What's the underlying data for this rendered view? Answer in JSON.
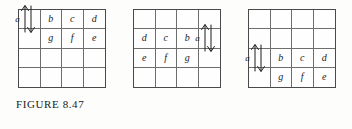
{
  "figure": {
    "caption": "FIGURE 8.47",
    "grid_rows": 4,
    "grid_cols": 4,
    "arrow_label": "a",
    "arrow_icon": "double-headed-vertical-arrow-icon",
    "line_color": "#4a4a4a",
    "inner_line_color": "#6e6e6e",
    "text_color": "#1c1c1c",
    "background": "#fdfdfb"
  },
  "grids": [
    {
      "name": "grid-left",
      "x": 18,
      "y": 9,
      "width": 88,
      "height": 79,
      "arrow": {
        "row": 1,
        "col": 1,
        "spans_rows": [
          1,
          2
        ]
      },
      "cells": [
        [
          "",
          "b",
          "c",
          "d"
        ],
        [
          "",
          "g",
          "f",
          "e"
        ],
        [
          "",
          "",
          "",
          ""
        ],
        [
          "",
          "",
          "",
          ""
        ]
      ]
    },
    {
      "name": "grid-middle",
      "x": 133,
      "y": 9,
      "width": 88,
      "height": 79,
      "arrow": {
        "row": 2,
        "col": 4,
        "spans_rows": [
          2,
          3
        ]
      },
      "cells": [
        [
          "",
          "",
          "",
          ""
        ],
        [
          "d",
          "c",
          "b",
          ""
        ],
        [
          "e",
          "f",
          "g",
          ""
        ],
        [
          "",
          "",
          "",
          ""
        ]
      ]
    },
    {
      "name": "grid-right",
      "x": 248,
      "y": 9,
      "width": 88,
      "height": 79,
      "arrow": {
        "row": 3,
        "col": 1,
        "spans_rows": [
          3,
          4
        ]
      },
      "cells": [
        [
          "",
          "",
          "",
          ""
        ],
        [
          "",
          "",
          "",
          ""
        ],
        [
          "",
          "b",
          "c",
          "d"
        ],
        [
          "",
          "g",
          "f",
          "e"
        ]
      ]
    }
  ]
}
